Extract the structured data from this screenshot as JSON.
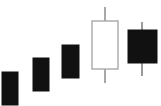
{
  "chart": {
    "title": "",
    "subtitle": "",
    "background_color": "#FFFFFF",
    "width": 161,
    "height": 106
  },
  "style": {
    "bearish_fill": "#111111",
    "bearish_stroke": "#111111",
    "bullish_fill": "#FFFFFF",
    "bullish_stroke": "#A8A8A8",
    "wick_color_bearish": "#9A9A9A",
    "wick_color_bullish": "#A8A8A8",
    "wick_width": 2
  },
  "chart_data": {
    "type": "candlestick",
    "title": "",
    "xlabel": "",
    "ylabel": "",
    "grid": false,
    "legend": null,
    "axes_visible": false,
    "tick_labels_visible": false,
    "categories": [
      "1",
      "2",
      "3",
      "4",
      "5"
    ],
    "ylim": [
      0,
      106
    ],
    "note": "Pixel geometry measured from the screenshot; y values are in screen pixels where smaller y is higher on the chart.",
    "candles": [
      {
        "index": 1,
        "direction": "bearish",
        "filled": true,
        "body_left": 2,
        "body_right": 18,
        "body_top": 72,
        "body_bottom": 105,
        "wick_high": 72,
        "wick_low": 105,
        "has_upper_wick": false,
        "has_lower_wick": false,
        "center_x": 10
      },
      {
        "index": 2,
        "direction": "bearish",
        "filled": true,
        "body_left": 33,
        "body_right": 49,
        "body_top": 58,
        "body_bottom": 91,
        "wick_high": 58,
        "wick_low": 91,
        "has_upper_wick": false,
        "has_lower_wick": false,
        "center_x": 41
      },
      {
        "index": 3,
        "direction": "bearish",
        "filled": true,
        "body_left": 62,
        "body_right": 79,
        "body_top": 45,
        "body_bottom": 78,
        "wick_high": 45,
        "wick_low": 78,
        "has_upper_wick": false,
        "has_lower_wick": false,
        "center_x": 70
      },
      {
        "index": 4,
        "direction": "bullish",
        "filled": false,
        "body_left": 92,
        "body_right": 118,
        "body_top": 21,
        "body_bottom": 69,
        "wick_high": 7,
        "wick_low": 83,
        "has_upper_wick": true,
        "has_lower_wick": true,
        "center_x": 105
      },
      {
        "index": 5,
        "direction": "bearish",
        "filled": true,
        "body_left": 128,
        "body_right": 157,
        "body_top": 30,
        "body_bottom": 63,
        "wick_high": 22,
        "wick_low": 76,
        "has_upper_wick": true,
        "has_lower_wick": true,
        "center_x": 142
      }
    ]
  }
}
